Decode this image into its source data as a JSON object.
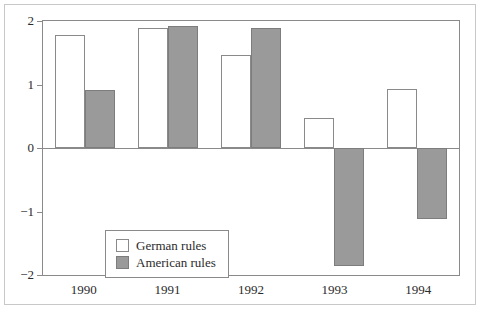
{
  "chart_data": {
    "type": "bar",
    "title": "",
    "xlabel": "",
    "ylabel": "",
    "categories": [
      "1990",
      "1991",
      "1992",
      "1993",
      "1994"
    ],
    "series": [
      {
        "name": "German rules",
        "values": [
          1.78,
          1.89,
          1.46,
          0.48,
          0.93
        ],
        "color": "#ffffff"
      },
      {
        "name": "American rules",
        "values": [
          0.91,
          1.92,
          1.89,
          -1.86,
          -1.12
        ],
        "color": "#9a9a9a"
      }
    ],
    "ylim": [
      -2,
      2
    ],
    "yticks": [
      2,
      1,
      0,
      -1,
      -2
    ],
    "ytick_labels": [
      "2",
      "1",
      "0",
      "−1",
      "−2"
    ],
    "grid": false,
    "legend_position": "inside-lower-left",
    "zero_line": true
  },
  "legend": {
    "items": [
      {
        "label": "German rules",
        "swatch": "german-swatch"
      },
      {
        "label": "American rules",
        "swatch": "american-swatch"
      }
    ]
  }
}
